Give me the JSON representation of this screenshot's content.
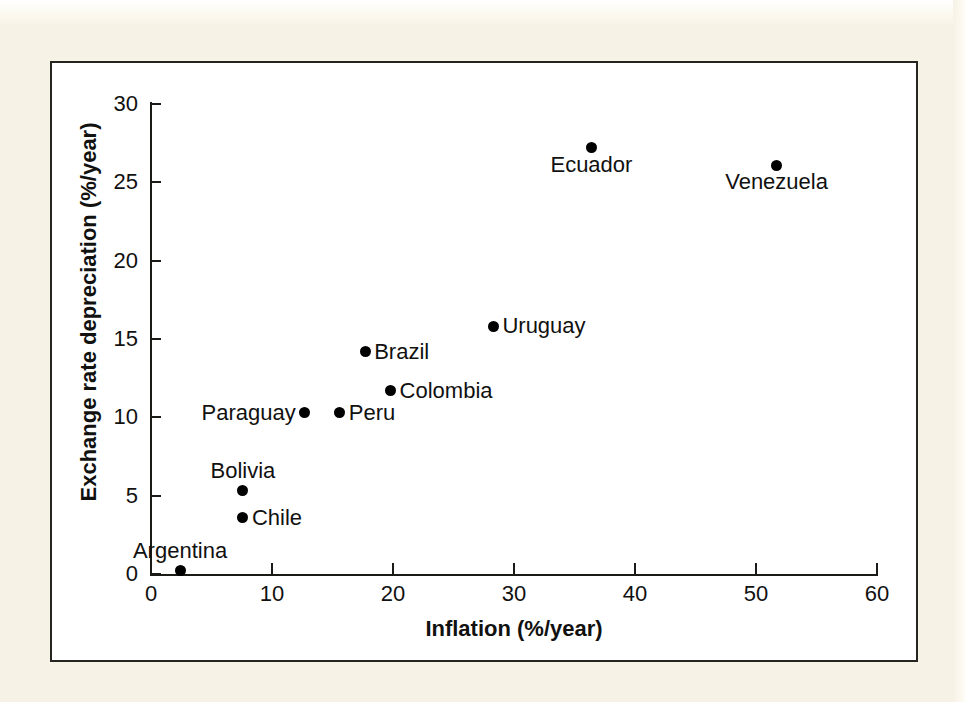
{
  "chart_data": {
    "type": "scatter",
    "title": "",
    "xlabel": "Inflation (%/year)",
    "ylabel": "Exchange rate depreciation (%/year)",
    "xlim": [
      0,
      60
    ],
    "ylim": [
      0,
      30
    ],
    "xticks": [
      0,
      10,
      20,
      30,
      40,
      50,
      60
    ],
    "yticks": [
      0,
      5,
      10,
      15,
      20,
      25,
      30
    ],
    "grid": false,
    "legend": "none",
    "point_color": "#000000",
    "points": [
      {
        "label": "Argentina",
        "x": 2.4,
        "y": 0.2,
        "label_pos": "above"
      },
      {
        "label": "Chile",
        "x": 7.6,
        "y": 3.6,
        "label_pos": "right"
      },
      {
        "label": "Bolivia",
        "x": 7.6,
        "y": 5.3,
        "label_pos": "above"
      },
      {
        "label": "Paraguay",
        "x": 12.7,
        "y": 10.3,
        "label_pos": "left"
      },
      {
        "label": "Peru",
        "x": 15.6,
        "y": 10.3,
        "label_pos": "right"
      },
      {
        "label": "Brazil",
        "x": 17.7,
        "y": 14.2,
        "label_pos": "right"
      },
      {
        "label": "Colombia",
        "x": 19.8,
        "y": 11.7,
        "label_pos": "right"
      },
      {
        "label": "Uruguay",
        "x": 28.3,
        "y": 15.8,
        "label_pos": "right"
      },
      {
        "label": "Ecuador",
        "x": 36.4,
        "y": 27.2,
        "label_pos": "below"
      },
      {
        "label": "Venezuela",
        "x": 51.7,
        "y": 26.1,
        "label_pos": "below"
      }
    ]
  },
  "figure": {
    "background_color": "#ffffff",
    "page_color": "#f7f2e6",
    "border_color": "#25241f"
  }
}
